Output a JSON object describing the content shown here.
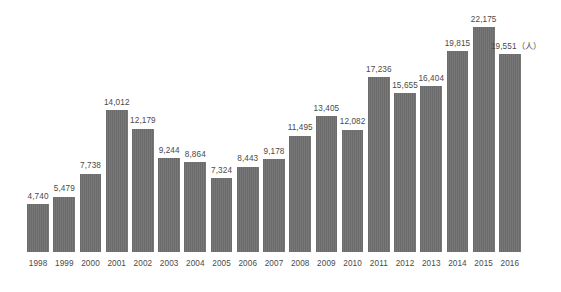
{
  "chart_data": {
    "type": "bar",
    "title": "",
    "subtitle": "",
    "xlabel": "",
    "ylabel": "",
    "unit_note": "（人）",
    "grid": false,
    "legend": "none",
    "ylim": [
      0,
      23500
    ],
    "categories": [
      "1998",
      "1999",
      "2000",
      "2001",
      "2002",
      "2003",
      "2004",
      "2005",
      "2006",
      "2007",
      "2008",
      "2009",
      "2010",
      "2011",
      "2012",
      "2013",
      "2014",
      "2015",
      "2016"
    ],
    "values": [
      4740,
      5479,
      7738,
      14012,
      12179,
      9244,
      8864,
      7324,
      8443,
      9178,
      11495,
      13405,
      12082,
      17236,
      15655,
      16404,
      19815,
      22175,
      19551
    ],
    "value_labels": [
      "4,740",
      "5,479",
      "7,738",
      "14,012",
      "12,179",
      "9,244",
      "8,864",
      "7,324",
      "8,443",
      "9,178",
      "11,495",
      "13,405",
      "12,082",
      "17,236",
      "15,655",
      "16,404",
      "19,815",
      "22,175",
      "19,551（人）"
    ],
    "series": [
      {
        "name": "",
        "values": [
          4740,
          5479,
          7738,
          14012,
          12179,
          9244,
          8864,
          7324,
          8443,
          9178,
          11495,
          13405,
          12082,
          17236,
          15655,
          16404,
          19815,
          22175,
          19551
        ]
      }
    ]
  },
  "style": {
    "bar_color": "#6b6b6b",
    "label_color": "#4a4a4a",
    "background": "#ffffff"
  }
}
